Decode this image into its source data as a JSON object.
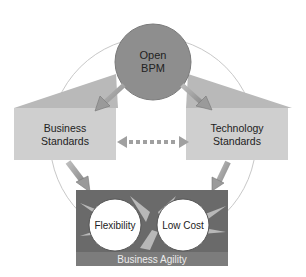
{
  "diagram": {
    "hub": {
      "label_line1": "Open",
      "label_line2": "BPM"
    },
    "left_box": {
      "label_line1": "Business",
      "label_line2": "Standards"
    },
    "right_box": {
      "label_line1": "Technology",
      "label_line2": "Standards"
    },
    "bottom_panel": {
      "title": "Business Agility",
      "bubbles": [
        "Flexibility",
        "Low Cost"
      ]
    },
    "connectors": [
      {
        "from": "Open BPM",
        "to": "Business Standards",
        "style": "arrow"
      },
      {
        "from": "Open BPM",
        "to": "Technology Standards",
        "style": "arrow"
      },
      {
        "from": "Business Standards",
        "to": "Technology Standards",
        "style": "dashed-bidirectional"
      },
      {
        "from": "Business Standards",
        "to": "Business Agility",
        "style": "arrow"
      },
      {
        "from": "Technology Standards",
        "to": "Business Agility",
        "style": "arrow"
      }
    ],
    "colors": {
      "hub": "#8e8e8e",
      "boxes": "#cfcfcf",
      "box_tops": "#b9b9b9",
      "panel": "#6a6a6a",
      "panel_title_bar": "#7c7c7c",
      "bubbles": "#ffffff",
      "ring": "#c8c8c8"
    }
  }
}
